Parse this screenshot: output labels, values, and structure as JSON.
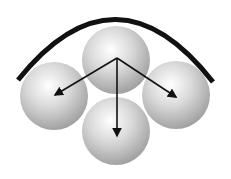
{
  "diagram": {
    "title": "",
    "background": "#ffffff",
    "arc": {
      "color": "#111111",
      "stroke_width": 5,
      "start": [
        18,
        80
      ],
      "control": [
        116,
        -42
      ],
      "end": [
        213,
        82
      ]
    },
    "spheres": [
      {
        "id": "top",
        "cx": 116,
        "cy": 60,
        "r": 34
      },
      {
        "id": "left",
        "cx": 54,
        "cy": 96,
        "r": 34
      },
      {
        "id": "right",
        "cx": 176,
        "cy": 95,
        "r": 34
      },
      {
        "id": "bottom",
        "cx": 116,
        "cy": 131,
        "r": 34
      }
    ],
    "sphere_colors": {
      "highlight": "#ffffff",
      "mid": "#d9d9d9",
      "shadow": "#9a9a9a"
    },
    "arrows": {
      "color": "#111111",
      "origin": [
        117,
        58
      ],
      "targets": [
        {
          "id": "to-left",
          "x": 55,
          "y": 95
        },
        {
          "id": "to-bottom",
          "x": 117,
          "y": 136
        },
        {
          "id": "to-right",
          "x": 176,
          "y": 97
        }
      ]
    }
  }
}
